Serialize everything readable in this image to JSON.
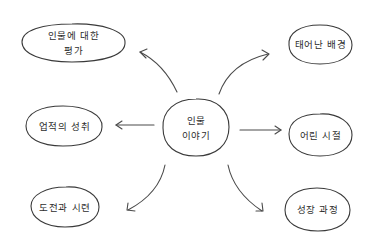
{
  "diagram": {
    "type": "mind-map",
    "style": "hand-drawn",
    "stroke_color": "#3a3a3a",
    "text_color": "#2e2e2e",
    "background": "#ffffff",
    "center": {
      "line1": "인물",
      "line2": "이야기"
    },
    "nodes": {
      "top_left": {
        "line1": "인물에 대한",
        "line2": "평가"
      },
      "middle_left": {
        "line1": "업적의 성취"
      },
      "bottom_left": {
        "line1": "도전과 시련"
      },
      "top_right": {
        "line1": "태어난 배경"
      },
      "middle_right": {
        "line1": "어린 시절"
      },
      "bottom_right": {
        "line1": "성장 과정"
      }
    },
    "edges": [
      {
        "from": "center",
        "to": "top_left"
      },
      {
        "from": "center",
        "to": "middle_left"
      },
      {
        "from": "center",
        "to": "bottom_left"
      },
      {
        "from": "center",
        "to": "top_right"
      },
      {
        "from": "center",
        "to": "middle_right"
      },
      {
        "from": "center",
        "to": "bottom_right"
      }
    ]
  }
}
